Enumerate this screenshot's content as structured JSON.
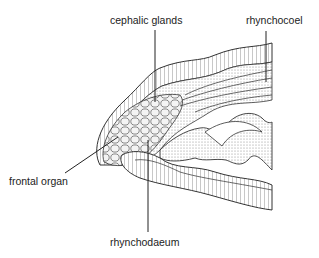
{
  "diagram": {
    "labels": [
      {
        "id": "cephalic-glands",
        "text": "cephalic glands"
      },
      {
        "id": "rhynchocoel",
        "text": "rhynchocoel"
      },
      {
        "id": "frontal-organ",
        "text": "frontal organ"
      },
      {
        "id": "rhynchodaeum",
        "text": "rhynchodaeum"
      }
    ]
  }
}
